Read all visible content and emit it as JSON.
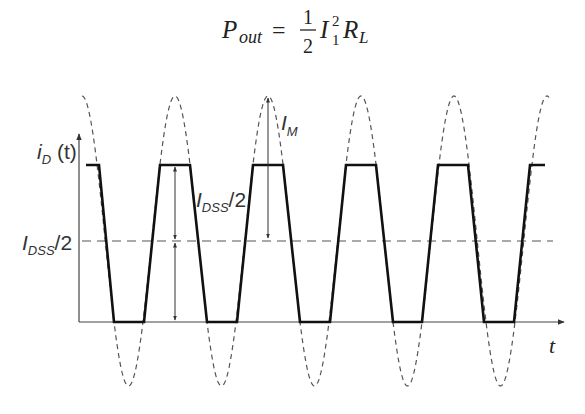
{
  "equation": {
    "lhs_symbol": "P",
    "lhs_subscript": "out",
    "equals": "=",
    "frac_numerator": "1",
    "frac_denominator": "2",
    "current_symbol": "I",
    "current_subscript": "1",
    "current_superscript": "2",
    "resistance_symbol": "R",
    "resistance_subscript": "L"
  },
  "diagram": {
    "y_axis_label_main": "i",
    "y_axis_label_sub": "D",
    "y_axis_label_arg": " (t)",
    "x_axis_label": "t",
    "level_label_main": "I",
    "level_label_sub": "DSS",
    "level_label_tail": "/2",
    "swing_label_main": "I",
    "swing_label_sub": "DSS",
    "swing_label_tail": "/2",
    "peak_label_main": "I",
    "peak_label_sub": "M",
    "colors": {
      "waveform": "#111111",
      "sine_dashed": "#555555",
      "axis": "#444444",
      "level_dashed": "#555555"
    }
  },
  "chart_data": {
    "type": "line",
    "xlabel": "t",
    "ylabel": "i_D (t)",
    "series": [
      {
        "name": "i_D(t) clipped waveform",
        "style": "solid",
        "description": "Trapezoid clipped between 0 and I_DSS, ~5 periods"
      },
      {
        "name": "sinusoid drive",
        "style": "dashed",
        "description": "Sinusoid centered at I_DSS/2 with amplitude I_M"
      }
    ],
    "annotations": [
      "I_DSS/2 (dc level, dashed horizontal)",
      "I_DSS/2 (upper swing arrow)",
      "I_M (peak amplitude arrow)"
    ],
    "y_levels": {
      "zero": 0,
      "I_DSS/2": 0.5,
      "I_DSS": 1.0,
      "peak": "I_DSS/2 + I_M"
    },
    "periods_shown": 5,
    "grid": false
  }
}
